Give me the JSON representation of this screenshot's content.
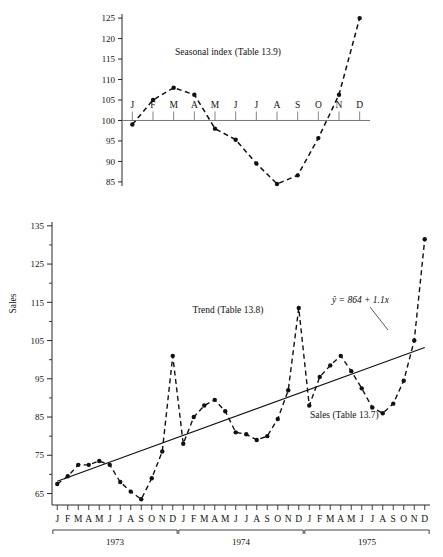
{
  "figure": {
    "width": 443,
    "height": 557,
    "background": "#ffffff",
    "ink": "#111111"
  },
  "chart_data": [
    {
      "type": "line",
      "id": "seasonal-index",
      "title": "Seasonal index (Table 13.9)",
      "xlabel": "",
      "ylabel": "",
      "categories": [
        "J",
        "F",
        "M",
        "A",
        "M",
        "J",
        "J",
        "A",
        "S",
        "O",
        "N",
        "D"
      ],
      "values": [
        99.0,
        105.0,
        108.0,
        106.3,
        98.0,
        95.3,
        89.5,
        84.5,
        86.6,
        95.7,
        106.3,
        125.0
      ],
      "ylim": [
        84,
        126
      ],
      "yticks": [
        85,
        90,
        95,
        100,
        105,
        110,
        115,
        120,
        125
      ],
      "ytick_labels": [
        "85",
        "90",
        "95",
        "100",
        "105",
        "110",
        "115",
        "120",
        "125"
      ],
      "baseline": 100,
      "grid": false,
      "legend": "none",
      "line_style": "dashed",
      "marker": "filled-circle"
    },
    {
      "type": "line",
      "id": "sales-trend",
      "title": "",
      "xlabel": "",
      "ylabel": "Sales",
      "ylim": [
        62,
        136
      ],
      "yticks": [
        65,
        75,
        85,
        95,
        105,
        115,
        125,
        135
      ],
      "ytick_labels": [
        "65",
        "75",
        "85",
        "95",
        "105",
        "115",
        "125",
        "135"
      ],
      "minor_ticks": [
        70,
        80,
        90,
        100,
        110,
        120,
        130
      ],
      "grid": false,
      "legend": "none",
      "categories": [
        "J",
        "F",
        "M",
        "A",
        "M",
        "J",
        "J",
        "A",
        "S",
        "O",
        "N",
        "D",
        "J",
        "F",
        "M",
        "A",
        "M",
        "J",
        "J",
        "A",
        "S",
        "O",
        "N",
        "D",
        "J",
        "F",
        "M",
        "A",
        "M",
        "J",
        "J",
        "A",
        "S",
        "O",
        "N",
        "D"
      ],
      "year_groups": [
        {
          "label": "1973",
          "start": 0,
          "end": 11
        },
        {
          "label": "1974",
          "start": 12,
          "end": 23
        },
        {
          "label": "1975",
          "start": 24,
          "end": 35
        }
      ],
      "series": [
        {
          "name": "Sales (Table 13.7)",
          "style": "dashed",
          "marker": "filled-circle",
          "values": [
            67.5,
            69.5,
            72.5,
            72.5,
            73.5,
            72.5,
            68.0,
            65.5,
            63.5,
            69.0,
            76.0,
            101.0,
            78.0,
            85.0,
            88.0,
            89.5,
            86.5,
            81.0,
            80.5,
            79.0,
            80.0,
            84.5,
            92.0,
            113.5,
            88.0,
            95.5,
            98.5,
            101.0,
            97.0,
            92.5,
            87.5,
            86.0,
            88.5,
            94.5,
            105.0,
            131.5
          ]
        },
        {
          "name": "Trend (Table 13.8)",
          "style": "solid",
          "marker": "none",
          "equation": "ŷ = 864 + 1.1x",
          "values": [
            68.2,
            69.2,
            70.2,
            71.2,
            72.2,
            73.2,
            74.2,
            75.2,
            76.2,
            77.2,
            78.2,
            79.2,
            80.2,
            81.2,
            82.2,
            83.2,
            84.2,
            85.2,
            86.2,
            87.2,
            88.2,
            89.2,
            90.2,
            91.2,
            92.2,
            93.2,
            94.2,
            95.2,
            96.2,
            97.2,
            98.2,
            99.2,
            100.2,
            101.2,
            102.2,
            103.2
          ]
        }
      ],
      "annotations": [
        {
          "id": "trend-label",
          "text": "Trend (Table 13.8)"
        },
        {
          "id": "sales-label",
          "text": "Sales (Table 13.7)"
        },
        {
          "id": "equation-label",
          "text": "ŷ = 864 + 1.1x"
        }
      ]
    }
  ],
  "top_chart": {
    "title": "Seasonal index (Table 13.9)",
    "y_tick_labels": [
      "125",
      "120",
      "115",
      "110",
      "105",
      "100",
      "95",
      "90",
      "85"
    ],
    "month_labels": [
      "J",
      "F",
      "M",
      "A",
      "M",
      "J",
      "J",
      "A",
      "S",
      "O",
      "N",
      "D"
    ]
  },
  "bottom_chart": {
    "y_axis_title": "Sales",
    "y_tick_labels": [
      "135",
      "125",
      "115",
      "105",
      "95",
      "85",
      "75",
      "65"
    ],
    "month_labels": [
      "J",
      "F",
      "M",
      "A",
      "M",
      "J",
      "J",
      "A",
      "S",
      "O",
      "N",
      "D"
    ],
    "year_labels": [
      "1973",
      "1974",
      "1975"
    ],
    "trend_label": "Trend (Table 13.8)",
    "sales_label": "Sales (Table 13.7)",
    "equation": "ŷ = 864 + 1.1x"
  }
}
